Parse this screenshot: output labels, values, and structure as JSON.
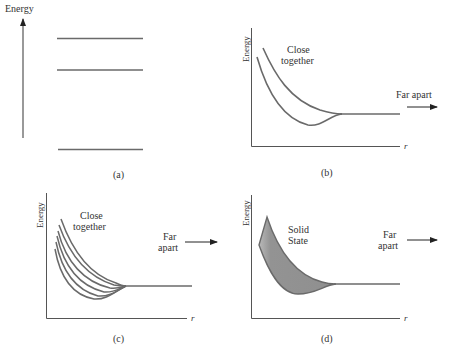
{
  "figure": {
    "colors": {
      "line": "#6a6a6a",
      "axis": "#555555",
      "text": "#333333",
      "fill": "#8f8f8f"
    },
    "panels": [
      {
        "id": "a",
        "caption": "(a)",
        "axis_label": "Energy",
        "energy_levels": 3
      },
      {
        "id": "b",
        "caption": "(b)",
        "y_label": "Energy",
        "x_label": "r",
        "annotation_close_line1": "Close",
        "annotation_close_line2": "together",
        "annotation_far": "Far apart",
        "curves": 2
      },
      {
        "id": "c",
        "caption": "(c)",
        "y_label": "Energy",
        "x_label": "r",
        "annotation_close_line1": "Close",
        "annotation_close_line2": "together",
        "annotation_far_line1": "Far",
        "annotation_far_line2": "apart",
        "curves": 6
      },
      {
        "id": "d",
        "caption": "(d)",
        "y_label": "Energy",
        "x_label": "r",
        "annotation_band_line1": "Solid",
        "annotation_band_line2": "State",
        "annotation_far_line1": "Far",
        "annotation_far_line2": "apart"
      }
    ]
  }
}
